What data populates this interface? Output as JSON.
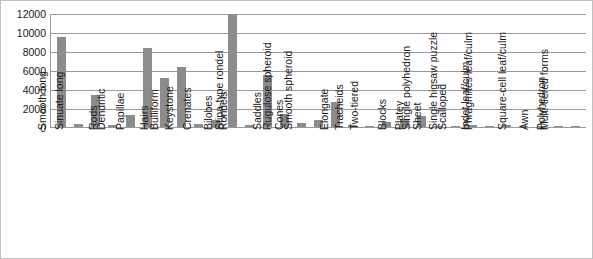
{
  "chart_data": {
    "type": "bar",
    "title": "",
    "subtitle": "",
    "xlabel": "",
    "ylabel": "",
    "ylim": [
      0,
      12000
    ],
    "y_ticks": [
      0,
      2000,
      4000,
      6000,
      8000,
      10000,
      12000
    ],
    "grid": true,
    "legend": "none",
    "bar_color": "#8c8c8c",
    "axis_color": "#9a9a9a",
    "categories": [
      "Smooth long",
      "Sinuate long",
      "Rods",
      "Dendritic",
      "Papillae",
      "Hairs",
      "Bulliform",
      "Keystone",
      "Crenates",
      "Bilobes",
      "Rondels",
      "Stipa-type rondel",
      "Saddles",
      "Cones",
      "Rugulose spheroid",
      "Smooth spheroid",
      "Elongate",
      "Tracheids",
      "Two-tiered",
      "Blocks",
      "Platey",
      "Sheet",
      "Single polyhedron",
      "Scalloped",
      "Single higsaw puzzle",
      "Indet leaf/culm",
      "Phragmites leaf/culm",
      "Awn",
      "Square-cell leaf/culm",
      "Polyhedron",
      "Multi-tiered forms"
    ],
    "values": [
      9500,
      300,
      3350,
      200,
      1250,
      8300,
      5200,
      6300,
      300,
      700,
      11800,
      200,
      5500,
      1400,
      400,
      700,
      2600,
      200,
      150,
      500,
      800,
      1150,
      150,
      100,
      250,
      150,
      250,
      100,
      100,
      100,
      60
    ]
  }
}
